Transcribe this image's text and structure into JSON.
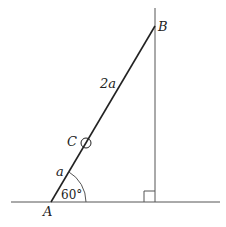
{
  "diagram": {
    "colors": {
      "stroke": "#222222",
      "thin_stroke": "#555555",
      "background": "#ffffff"
    },
    "points": {
      "A": {
        "label": "A",
        "x": 51,
        "y": 202
      },
      "B": {
        "label": "B",
        "x": 155,
        "y": 26
      },
      "C": {
        "label": "C",
        "x": 86,
        "y": 143
      }
    },
    "segments": {
      "AC_length": "a",
      "CB_length": "2a"
    },
    "angle": {
      "vertex": "A",
      "value": "60°"
    },
    "right_angle": {
      "at": "foot of perpendicular from B"
    }
  }
}
